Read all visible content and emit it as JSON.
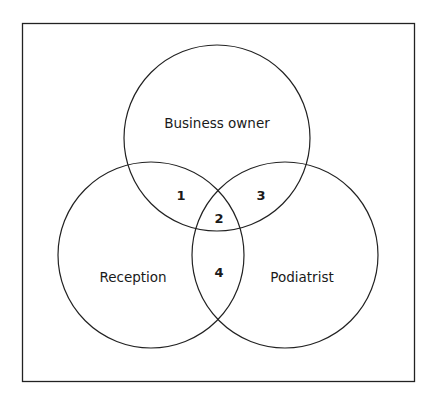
{
  "diagram": {
    "type": "venn",
    "sets": [
      {
        "id": "business_owner",
        "label": "Business owner"
      },
      {
        "id": "reception",
        "label": "Reception"
      },
      {
        "id": "podiatrist",
        "label": "Podiatrist"
      }
    ],
    "regions": [
      {
        "label": "1",
        "sets": [
          "business_owner",
          "reception"
        ]
      },
      {
        "label": "2",
        "sets": [
          "business_owner",
          "reception",
          "podiatrist"
        ]
      },
      {
        "label": "3",
        "sets": [
          "business_owner",
          "podiatrist"
        ]
      },
      {
        "label": "4",
        "sets": [
          "reception",
          "podiatrist"
        ]
      }
    ],
    "colors": {
      "stroke": "#222222",
      "background": "#ffffff"
    }
  }
}
